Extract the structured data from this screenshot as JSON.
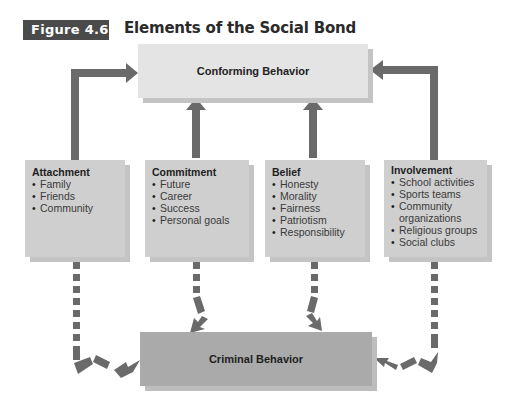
{
  "figure": {
    "label": "Figure 4.6",
    "title": "Elements of the Social Bond"
  },
  "colors": {
    "badge": "#4a4a4a",
    "arrow": "#6a6a6a",
    "conforming_box": "#e4e4e4",
    "criminal_box": "#aaaaaa",
    "element_box": "#cfcfcf"
  },
  "outcomes": {
    "conforming": "Conforming Behavior",
    "criminal": "Criminal Behavior"
  },
  "elements": [
    {
      "title": "Attachment",
      "items": [
        "Family",
        "Friends",
        "Community"
      ]
    },
    {
      "title": "Commitment",
      "items": [
        "Future",
        "Career",
        "Success",
        "Personal goals"
      ]
    },
    {
      "title": "Belief",
      "items": [
        "Honesty",
        "Morality",
        "Fairness",
        "Patriotism",
        "Responsibility"
      ]
    },
    {
      "title": "Involvement",
      "items": [
        "School activities",
        "Sports teams",
        "Community organizations",
        "Religious groups",
        "Social clubs"
      ]
    }
  ],
  "connectors": {
    "solid_to": "Conforming Behavior",
    "dashed_to": "Criminal Behavior"
  }
}
